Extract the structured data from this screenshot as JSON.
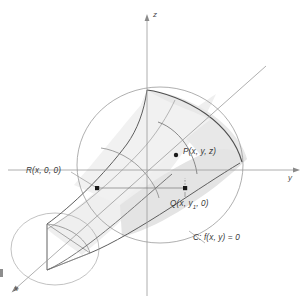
{
  "figure": {
    "kind": "3d-math-diagram",
    "background_color": "#ffffff",
    "line_color": "#6e6e6e",
    "dark_line_color": "#4a4a4a",
    "axis_color": "#8a8a8a",
    "shade_light": "#f2f2f2",
    "shade_mid": "#e6e6e6",
    "shade_dark": "#dcdcdc",
    "point_color": "#1a1a1a"
  },
  "axes": [
    {
      "name": "z-axis",
      "label": "z",
      "direction": "up"
    },
    {
      "name": "y-axis",
      "label": "y",
      "direction": "right"
    },
    {
      "name": "x-axis",
      "label": "x",
      "direction": "down-left"
    }
  ],
  "points": [
    {
      "name": "P",
      "label_prefix": "P",
      "label_args": "(x, y, z)",
      "full_label": "P(x, y, z)"
    },
    {
      "name": "Q",
      "label_prefix": "Q",
      "label_args_pre": "(x, y",
      "label_sub": "1",
      "label_args_post": ", 0)",
      "full_label": "Q(x, y1, 0)"
    },
    {
      "name": "R",
      "label_prefix": "R",
      "label_args": "(x, 0, 0)",
      "full_label": "R(x, 0, 0)"
    }
  ],
  "curve": {
    "name": "C",
    "label": "C: f(x, y) = 0",
    "equation": "f(x, y) = 0"
  }
}
